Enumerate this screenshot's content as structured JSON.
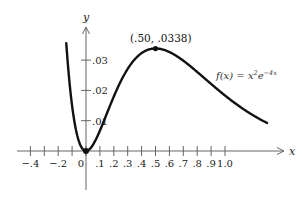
{
  "chart_data": {
    "type": "line",
    "title": "",
    "xlabel": "x",
    "ylabel": "y",
    "function_label": "f(x) = x²e⁻⁴ˣ",
    "function_parts": {
      "lhs": "f(x) = x",
      "exp1": "2",
      "mid": "e",
      "exp2": "−4x"
    },
    "x_ticks": [
      -0.4,
      -0.3,
      -0.2,
      -0.1,
      0,
      0.1,
      0.2,
      0.3,
      0.4,
      0.5,
      0.6,
      0.7,
      0.8,
      0.9,
      1.0
    ],
    "x_tick_labels": [
      "−.4",
      "−.2",
      "0",
      ".1",
      ".2",
      ".3",
      ".4",
      ".5",
      ".6",
      ".7",
      ".8",
      ".9",
      "1.0"
    ],
    "y_ticks": [
      0.01,
      0.02,
      0.03
    ],
    "y_tick_labels": [
      ".01",
      ".02",
      ".03"
    ],
    "xlim": [
      -0.45,
      1.35
    ],
    "ylim": [
      0,
      0.038
    ],
    "grid": false,
    "series": [
      {
        "name": "f(x) = x^2 e^(-4x)",
        "x": [
          -0.15,
          -0.1,
          -0.05,
          0,
          0.05,
          0.1,
          0.2,
          0.3,
          0.4,
          0.5,
          0.6,
          0.7,
          0.8,
          0.9,
          1.0,
          1.1,
          1.2,
          1.3
        ],
        "y": [
          0.041,
          0.0149,
          0.0031,
          0,
          0.002,
          0.0067,
          0.018,
          0.0271,
          0.0323,
          0.0338,
          0.0327,
          0.0299,
          0.0261,
          0.0221,
          0.0183,
          0.0148,
          0.0119,
          0.0093
        ]
      }
    ],
    "annotations": [
      {
        "label": "(.50, .0338)",
        "x": 0.5,
        "y": 0.0338,
        "type": "maximum point"
      },
      {
        "label": "(0, 0)",
        "x": 0,
        "y": 0,
        "type": "minimum point"
      }
    ]
  }
}
